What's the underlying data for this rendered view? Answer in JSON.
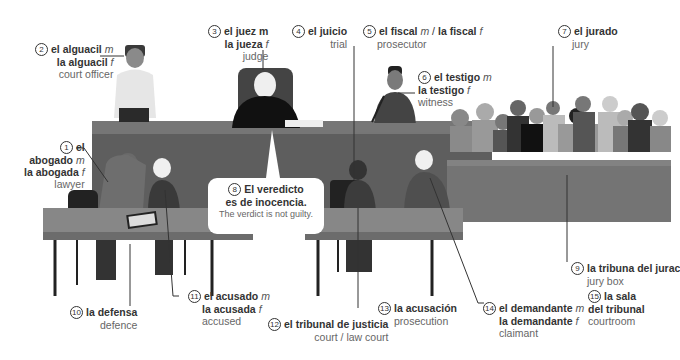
{
  "labels": [
    {
      "num": "1",
      "es_m": "el abogado",
      "es_f": "la abogada",
      "en": "lawyer"
    },
    {
      "num": "2",
      "es_m": "el alguacil",
      "es_f": "la alguacil",
      "en": "court officer"
    },
    {
      "num": "3",
      "es_m": "el juez m",
      "es_f": "la jueza",
      "en": "judge"
    },
    {
      "num": "4",
      "es": "el juicio",
      "en": "trial"
    },
    {
      "num": "5",
      "es": "el fiscal",
      "es_f": "la fiscal",
      "en": "prosecutor"
    },
    {
      "num": "6",
      "es_m": "el testigo",
      "es_f": "la testigo",
      "en": "witness"
    },
    {
      "num": "7",
      "es": "el jurado",
      "en": "jury"
    },
    {
      "num": "8",
      "es": "El veredicto es de inocencia.",
      "es_l1": "El veredicto",
      "es_l2": "es de inocencia.",
      "en": "The verdict is not guilty."
    },
    {
      "num": "9",
      "es": "la tribuna del jurado",
      "es_visible": "la tribuna del jurac",
      "en": "jury box"
    },
    {
      "num": "10",
      "es": "la defensa",
      "en": "defence"
    },
    {
      "num": "11",
      "es_m": "el acusado",
      "es_f": "la acusada",
      "en": "accused"
    },
    {
      "num": "12",
      "es": "el tribunal de justicia",
      "en": "court / law court"
    },
    {
      "num": "13",
      "es": "la acusación",
      "en": "prosecution"
    },
    {
      "num": "14",
      "es_m": "el demandante",
      "es_f": "la demandante",
      "en": "claimant"
    },
    {
      "num": "15",
      "es_l1": "la sala",
      "es_l2": "del tribunal",
      "en": "courtroom"
    }
  ],
  "gender": {
    "m": "m",
    "f": "f"
  },
  "colors": {
    "bench": "#6b6b6b",
    "bench_top": "#7d7d7d",
    "table": "#8a8a8a",
    "jury_box": "#777777",
    "text": "#333333",
    "text_en": "#666666"
  }
}
